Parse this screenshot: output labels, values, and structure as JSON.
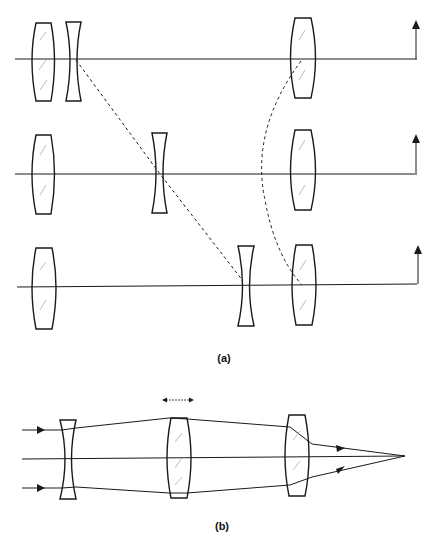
{
  "figure": {
    "caption_a": "(a)",
    "caption_b": "(b)",
    "colors": {
      "stroke": "#1a1a1a",
      "hatch": "#bdbdbd",
      "background": "#ffffff"
    }
  },
  "panel_a": {
    "description": "Zoom lens configurations: fixed front positive lens, moving negative lens, compensating positive lens",
    "rows": [
      {
        "axis_y": 59,
        "front_lens_x": 44,
        "negative_lens_x": 73,
        "rear_lens_x": 303
      },
      {
        "axis_y": 174,
        "front_lens_x": 44,
        "negative_lens_x": 160,
        "rear_lens_x": 303
      },
      {
        "axis_y": 286,
        "front_lens_x": 44,
        "negative_lens_x": 246,
        "rear_lens_x": 304
      }
    ]
  },
  "panel_b": {
    "description": "Ray diagram: negative lens, movable positive lens, fixed positive lens focusing to point",
    "lenses": [
      {
        "type": "negative",
        "x": 68
      },
      {
        "type": "positive-movable",
        "x": 179
      },
      {
        "type": "positive",
        "x": 297
      }
    ],
    "focus_point": {
      "x": 405,
      "y": 456
    }
  }
}
